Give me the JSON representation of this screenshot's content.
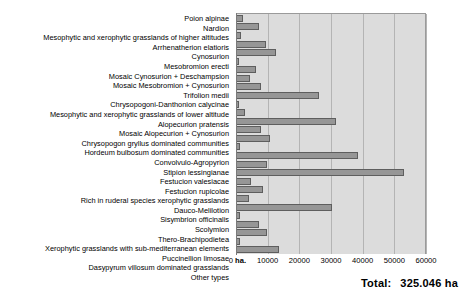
{
  "chart_data": {
    "type": "bar",
    "orientation": "horizontal",
    "title": "",
    "xlabel": "",
    "ylabel": "",
    "xlim": [
      0,
      60000
    ],
    "grid": true,
    "legend": null,
    "xticks": [
      {
        "value": 0,
        "label": "0 ha."
      },
      {
        "value": 10000,
        "label": "10000"
      },
      {
        "value": 20000,
        "label": "20000"
      },
      {
        "value": 30000,
        "label": "30000"
      },
      {
        "value": 40000,
        "label": "40000"
      },
      {
        "value": 50000,
        "label": "50000"
      },
      {
        "value": 60000,
        "label": "60000"
      }
    ],
    "categories": [
      "Poion alpinae",
      "Nardion",
      "Mesophytic and xerophytic grasslands of higher altitudes",
      "Arrhenatherion elatioris",
      "Cynosurion",
      "Mesobromion erecti",
      "Mosaic Cynosurion + Deschampsion",
      "Mosaic Mesobromion + Cynosurion",
      "Trifolion medii",
      "Chrysopogoni-Danthonion calycinae",
      "Mesophytic and xerophytic grasslands of lower altitude",
      "Alopecurion pratensis",
      "Mosaic Alopecurion + Cynosurion",
      "Chrysopogon gryllus dominated communities",
      "Hordeum bulbosum dominated communities",
      "Convolvulo-Agropyrion",
      "Stipion lessingianae",
      "Festucion valesiacae",
      "Festucion rupicolae",
      "Rich in ruderal species xerophytic grasslands",
      "Dauco-Melilotion",
      "Sisymbrion officinalis",
      "Scolymion",
      "Thero-Brachipodietea",
      "Xerophytic grasslands with sub-mediterranean elements",
      "Puccinellion limosae",
      "Dasypyrum villosum dominated grasslands",
      "Other types"
    ],
    "values": [
      2100,
      7200,
      1500,
      9400,
      12700,
      1100,
      6200,
      4500,
      8000,
      26200,
      1000,
      2700,
      31500,
      7800,
      10600,
      1200,
      38500,
      9700,
      53200,
      4600,
      8500,
      4000,
      30200,
      1400,
      7200,
      9800,
      1300,
      13600
    ]
  },
  "footer": {
    "total_label": "Total:",
    "total_value": "325.046 ha"
  }
}
